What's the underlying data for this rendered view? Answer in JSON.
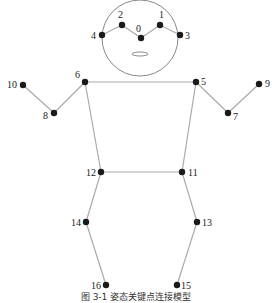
{
  "figure": {
    "caption": "图 3-1 姿态关键点连接模型",
    "colors": {
      "line": "#aaaaaa",
      "point": "#1a1a1a",
      "head": "#888888",
      "text": "#222222"
    },
    "head": {
      "cx": 140,
      "cy": 38,
      "r": 38
    },
    "mouth": {
      "cx": 140,
      "cy": 54,
      "rx": 8,
      "ry": 2
    },
    "keypoints": [
      {
        "id": "0",
        "x": 141,
        "y": 38,
        "lx": 136,
        "ly": 32,
        "anchor": "start"
      },
      {
        "id": "1",
        "x": 160,
        "y": 25,
        "lx": 159,
        "ly": 18,
        "anchor": "start"
      },
      {
        "id": "2",
        "x": 122,
        "y": 25,
        "lx": 118,
        "ly": 18,
        "anchor": "start"
      },
      {
        "id": "3",
        "x": 180,
        "y": 35,
        "lx": 185,
        "ly": 39,
        "anchor": "start"
      },
      {
        "id": "4",
        "x": 102,
        "y": 35,
        "lx": 96,
        "ly": 39,
        "anchor": "end"
      },
      {
        "id": "5",
        "x": 196,
        "y": 82,
        "lx": 201,
        "ly": 85,
        "anchor": "start"
      },
      {
        "id": "6",
        "x": 85,
        "y": 82,
        "lx": 80,
        "ly": 78,
        "anchor": "end"
      },
      {
        "id": "7",
        "x": 228,
        "y": 113,
        "lx": 233,
        "ly": 120,
        "anchor": "start"
      },
      {
        "id": "8",
        "x": 54,
        "y": 113,
        "lx": 48,
        "ly": 119,
        "anchor": "end"
      },
      {
        "id": "9",
        "x": 259,
        "y": 84,
        "lx": 265,
        "ly": 87,
        "anchor": "start"
      },
      {
        "id": "10",
        "x": 23,
        "y": 85,
        "lx": 17,
        "ly": 88,
        "anchor": "end"
      },
      {
        "id": "11",
        "x": 182,
        "y": 172,
        "lx": 188,
        "ly": 176,
        "anchor": "start"
      },
      {
        "id": "12",
        "x": 101,
        "y": 172,
        "lx": 96,
        "ly": 176,
        "anchor": "end"
      },
      {
        "id": "13",
        "x": 197,
        "y": 222,
        "lx": 202,
        "ly": 226,
        "anchor": "start"
      },
      {
        "id": "14",
        "x": 86,
        "y": 222,
        "lx": 81,
        "ly": 226,
        "anchor": "end"
      },
      {
        "id": "15",
        "x": 177,
        "y": 285,
        "lx": 181,
        "ly": 289,
        "anchor": "start"
      },
      {
        "id": "16",
        "x": 106,
        "y": 285,
        "lx": 101,
        "ly": 289,
        "anchor": "end"
      }
    ],
    "connections": [
      [
        "4",
        "2"
      ],
      [
        "2",
        "0"
      ],
      [
        "0",
        "1"
      ],
      [
        "1",
        "3"
      ],
      [
        "6",
        "5"
      ],
      [
        "6",
        "8"
      ],
      [
        "8",
        "10"
      ],
      [
        "5",
        "7"
      ],
      [
        "7",
        "9"
      ],
      [
        "6",
        "12"
      ],
      [
        "5",
        "11"
      ],
      [
        "12",
        "11"
      ],
      [
        "12",
        "14"
      ],
      [
        "14",
        "16"
      ],
      [
        "11",
        "13"
      ],
      [
        "13",
        "15"
      ]
    ]
  }
}
